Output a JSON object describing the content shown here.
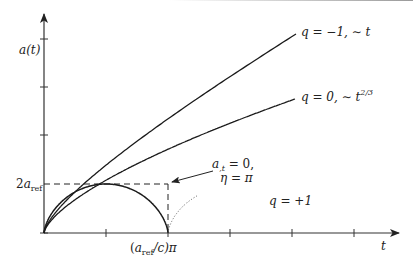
{
  "figure": {
    "y_axis_label": "a(t)",
    "x_axis_label": "t",
    "y_marker_label": {
      "coef": "2",
      "main": "a",
      "sub": "ref"
    },
    "x_marker_label": {
      "open": "(",
      "main": "a",
      "sub": "ref",
      "rest": "/c)π"
    },
    "annotation": {
      "line1_main": "a",
      "line1_sub": ",t",
      "line1_rest": " = 0,",
      "line2": "η = π"
    },
    "curve_labels": {
      "open": {
        "text": "q = −1, ∼ t"
      },
      "flat": {
        "text": "q = 0, ∼ t",
        "sup": "2/3"
      },
      "closed": {
        "text": "q = +1"
      }
    },
    "colors": {
      "curve": "#1a1a1a",
      "axis": "#333333",
      "dotted": "#555555"
    }
  }
}
